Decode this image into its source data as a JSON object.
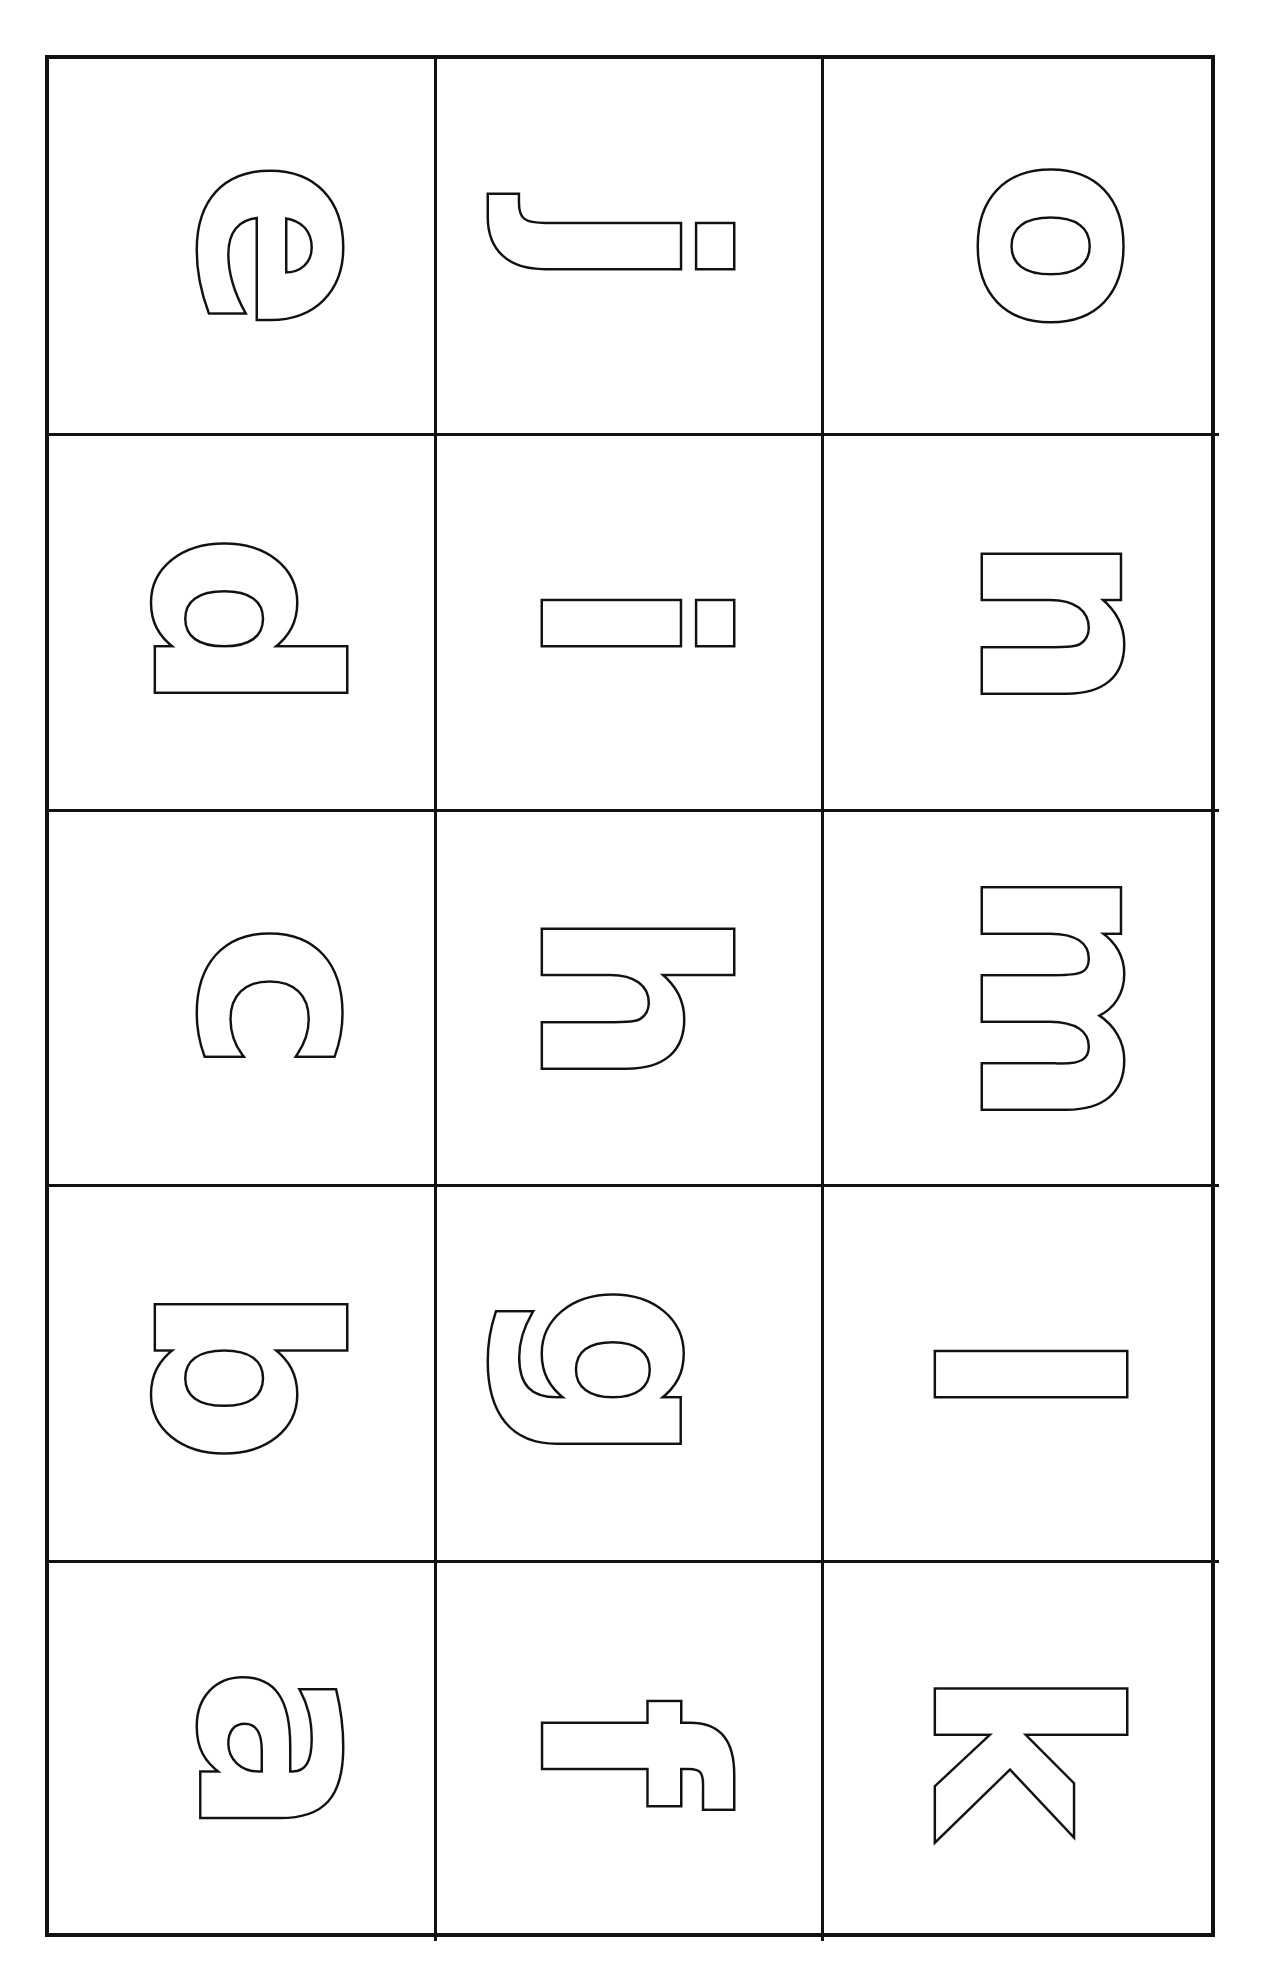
{
  "worksheet": {
    "title": "",
    "layout": "5 rows x 3 columns, letters rotated 90 degrees, outline style",
    "rows": [
      [
        "e",
        "j",
        "o"
      ],
      [
        "d",
        "i",
        "n"
      ],
      [
        "c",
        "h",
        "m"
      ],
      [
        "b",
        "g",
        "l"
      ],
      [
        "a",
        "f",
        "k"
      ]
    ],
    "colors": {
      "line": "#111111",
      "background": "#ffffff",
      "fill": "#ffffff"
    }
  }
}
